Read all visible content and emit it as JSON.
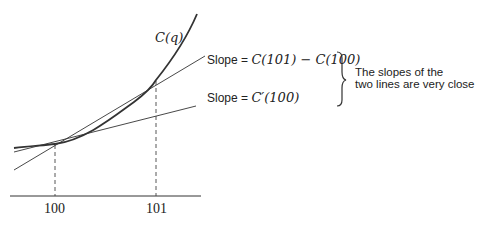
{
  "diagram": {
    "curve_label": "C(q)",
    "secant_label_prefix": "Slope = ",
    "secant_label_expr": "C(101) − C(100)",
    "tangent_label_prefix": "Slope = ",
    "tangent_label_expr": "C′(100)",
    "note_line1": "The slopes of the",
    "note_line2": "two lines are very close",
    "x_ticks": [
      "100",
      "101"
    ],
    "colors": {
      "stroke": "#333333",
      "text": "#222222",
      "background": "#ffffff"
    }
  }
}
